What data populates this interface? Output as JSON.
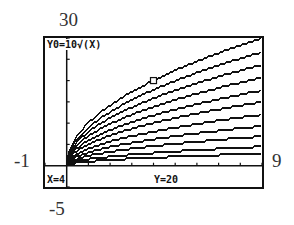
{
  "window": {
    "xmin": "-1",
    "xmax": "9",
    "ymin": "-5",
    "ymax": "30"
  },
  "screen": {
    "function_label": "Y0=10√(X)",
    "x_readout": "X=4",
    "y_readout": "Y=20"
  },
  "cursor": {
    "x": 4,
    "y": 20
  },
  "colors": {
    "ink": "#111111",
    "background": "#ffffff"
  },
  "chart_data": {
    "type": "line",
    "title": "Y0=10√(X)",
    "xlabel": "",
    "ylabel": "",
    "xlim": [
      -1,
      9
    ],
    "ylim": [
      -5,
      30
    ],
    "x_tick_step": 1,
    "y_tick_step": 5,
    "grid": false,
    "annotations": [
      "X=4",
      "Y=20",
      "cursor at (4, 20)"
    ],
    "series": [
      {
        "name": "10√x",
        "coef": 10.0,
        "x": [
          0,
          1,
          4,
          9
        ],
        "values": [
          0,
          10,
          20,
          30
        ]
      },
      {
        "name": "c·√x",
        "coef": 8.9,
        "x": [
          0,
          1,
          4,
          9
        ],
        "values": [
          0,
          8.9,
          17.8,
          26.7
        ]
      },
      {
        "name": "c·√x",
        "coef": 7.9,
        "x": [
          0,
          1,
          4,
          9
        ],
        "values": [
          0,
          7.9,
          15.8,
          23.7
        ]
      },
      {
        "name": "c·√x",
        "coef": 6.9,
        "x": [
          0,
          1,
          4,
          9
        ],
        "values": [
          0,
          6.9,
          13.8,
          20.7
        ]
      },
      {
        "name": "c·√x",
        "coef": 5.9,
        "x": [
          0,
          1,
          4,
          9
        ],
        "values": [
          0,
          5.9,
          11.8,
          17.7
        ]
      },
      {
        "name": "c·√x",
        "coef": 5.0,
        "x": [
          0,
          1,
          4,
          9
        ],
        "values": [
          0,
          5.0,
          10.0,
          15.0
        ]
      },
      {
        "name": "c·√x",
        "coef": 4.0,
        "x": [
          0,
          1,
          4,
          9
        ],
        "values": [
          0,
          4.0,
          8.0,
          12.0
        ]
      },
      {
        "name": "c·√x",
        "coef": 3.1,
        "x": [
          0,
          1,
          4,
          9
        ],
        "values": [
          0,
          3.1,
          6.2,
          9.3
        ]
      },
      {
        "name": "c·√x",
        "coef": 2.3,
        "x": [
          0,
          1,
          4,
          9
        ],
        "values": [
          0,
          2.3,
          4.6,
          6.9
        ]
      },
      {
        "name": "c·√x",
        "coef": 1.5,
        "x": [
          0,
          1,
          4,
          9
        ],
        "values": [
          0,
          1.5,
          3.0,
          4.5
        ]
      },
      {
        "name": "c·√x",
        "coef": 0.95,
        "x": [
          0,
          1,
          4,
          9
        ],
        "values": [
          0,
          0.95,
          1.9,
          2.85
        ]
      }
    ]
  }
}
